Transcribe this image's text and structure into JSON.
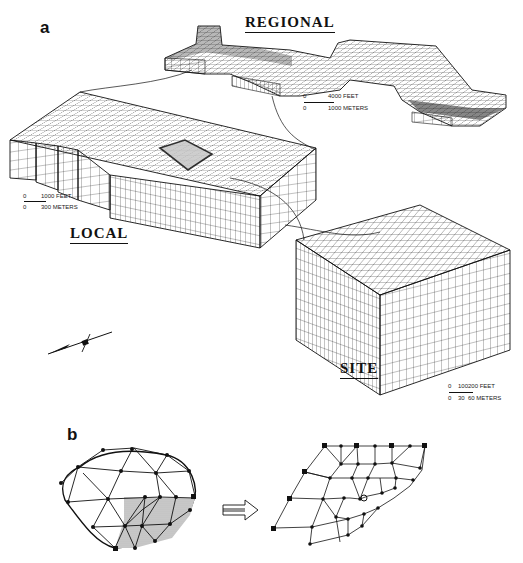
{
  "figure": {
    "panel_a_label": "a",
    "panel_b_label": "b",
    "regional": {
      "title": "REGIONAL",
      "scale": {
        "zero_top": "0",
        "feet": "4000 FEET",
        "zero_bottom": "0",
        "meters": "1000 METERS"
      }
    },
    "local": {
      "title": "LOCAL",
      "scale": {
        "zero_top": "0",
        "feet": "1000 FEET",
        "zero_bottom": "0",
        "meters": "300 METERS"
      }
    },
    "site": {
      "title": "SITE",
      "scale": {
        "zero_top": "0",
        "feet_mid": "100",
        "feet": "200 FEET",
        "zero_bottom": "0",
        "meters_mid": "30",
        "meters": "60 METERS"
      }
    },
    "north_arrow": "north-arrow",
    "refinement_arrow": "double-arrow-right",
    "colors": {
      "ink": "#111111",
      "shade": "#bdbdbd",
      "background": "#ffffff"
    }
  }
}
